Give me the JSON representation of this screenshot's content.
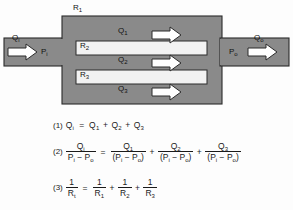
{
  "figure": {
    "type": "parallel-flow-resistance-diagram",
    "colors": {
      "block_fill": "#8a8a8a",
      "channel_fill": "#f2f2f2",
      "outline": "#2b2b2b",
      "arrow_fill": "#ffffff",
      "background": "#fdfdfd",
      "text": "#141414"
    },
    "labels": {
      "inlet_flow": "Q",
      "inlet_flow_sub": "i",
      "inlet_pressure": "P",
      "inlet_pressure_sub": "i",
      "outlet_pressure": "P",
      "outlet_pressure_sub": "o",
      "outlet_flow": "Q",
      "outlet_flow_sub": "o",
      "resistance_1": "R",
      "resistance_1_sub": "1",
      "resistance_2": "R",
      "resistance_2_sub": "2",
      "resistance_3": "R",
      "resistance_3_sub": "3",
      "branch_flow_1": "Q",
      "branch_flow_1_sub": "1",
      "branch_flow_2": "Q",
      "branch_flow_2_sub": "2",
      "branch_flow_3": "Q",
      "branch_flow_3_sub": "3"
    },
    "arrow_icons": {
      "inlet": "right-arrow-icon",
      "branch_1": "right-arrow-icon",
      "branch_2": "right-arrow-icon",
      "branch_3": "right-arrow-icon",
      "outlet": "right-arrow-icon"
    }
  },
  "equations": {
    "eq1": {
      "number": "(1)",
      "lhs": "Q",
      "lhs_sub": "i",
      "eq": "=",
      "terms": [
        {
          "sym": "Q",
          "sub": "1"
        },
        {
          "sym": "Q",
          "sub": "2"
        },
        {
          "sym": "Q",
          "sub": "3"
        }
      ],
      "op": "+"
    },
    "eq2": {
      "number": "(2)",
      "eq": "=",
      "op": "+",
      "lhs": {
        "num_sym": "Q",
        "num_sub": "i",
        "den": "P",
        "den_sub1": "i",
        "den_minus": "−",
        "den2": "P",
        "den_sub2": "o"
      },
      "terms": [
        {
          "num_sym": "Q",
          "num_sub": "1",
          "den_open": "(",
          "den1": "P",
          "den_sub1": "i",
          "den_minus": "−",
          "den2": "P",
          "den_sub2": "o",
          "den_close": ")"
        },
        {
          "num_sym": "Q",
          "num_sub": "2",
          "den_open": "(",
          "den1": "P",
          "den_sub1": "i",
          "den_minus": "−",
          "den2": "P",
          "den_sub2": "o",
          "den_close": ")"
        },
        {
          "num_sym": "Q",
          "num_sub": "3",
          "den_open": "(",
          "den1": "P",
          "den_sub1": "i",
          "den_minus": "−",
          "den2": "P",
          "den_sub2": "o",
          "den_close": ")"
        }
      ]
    },
    "eq3": {
      "number": "(3)",
      "eq": "=",
      "op": "+",
      "one": "1",
      "lhs_den": "R",
      "lhs_den_sub": "t",
      "terms": [
        {
          "one": "1",
          "den": "R",
          "den_sub": "1"
        },
        {
          "one": "1",
          "den": "R",
          "den_sub": "2"
        },
        {
          "one": "1",
          "den": "R",
          "den_sub": "3"
        }
      ]
    }
  }
}
